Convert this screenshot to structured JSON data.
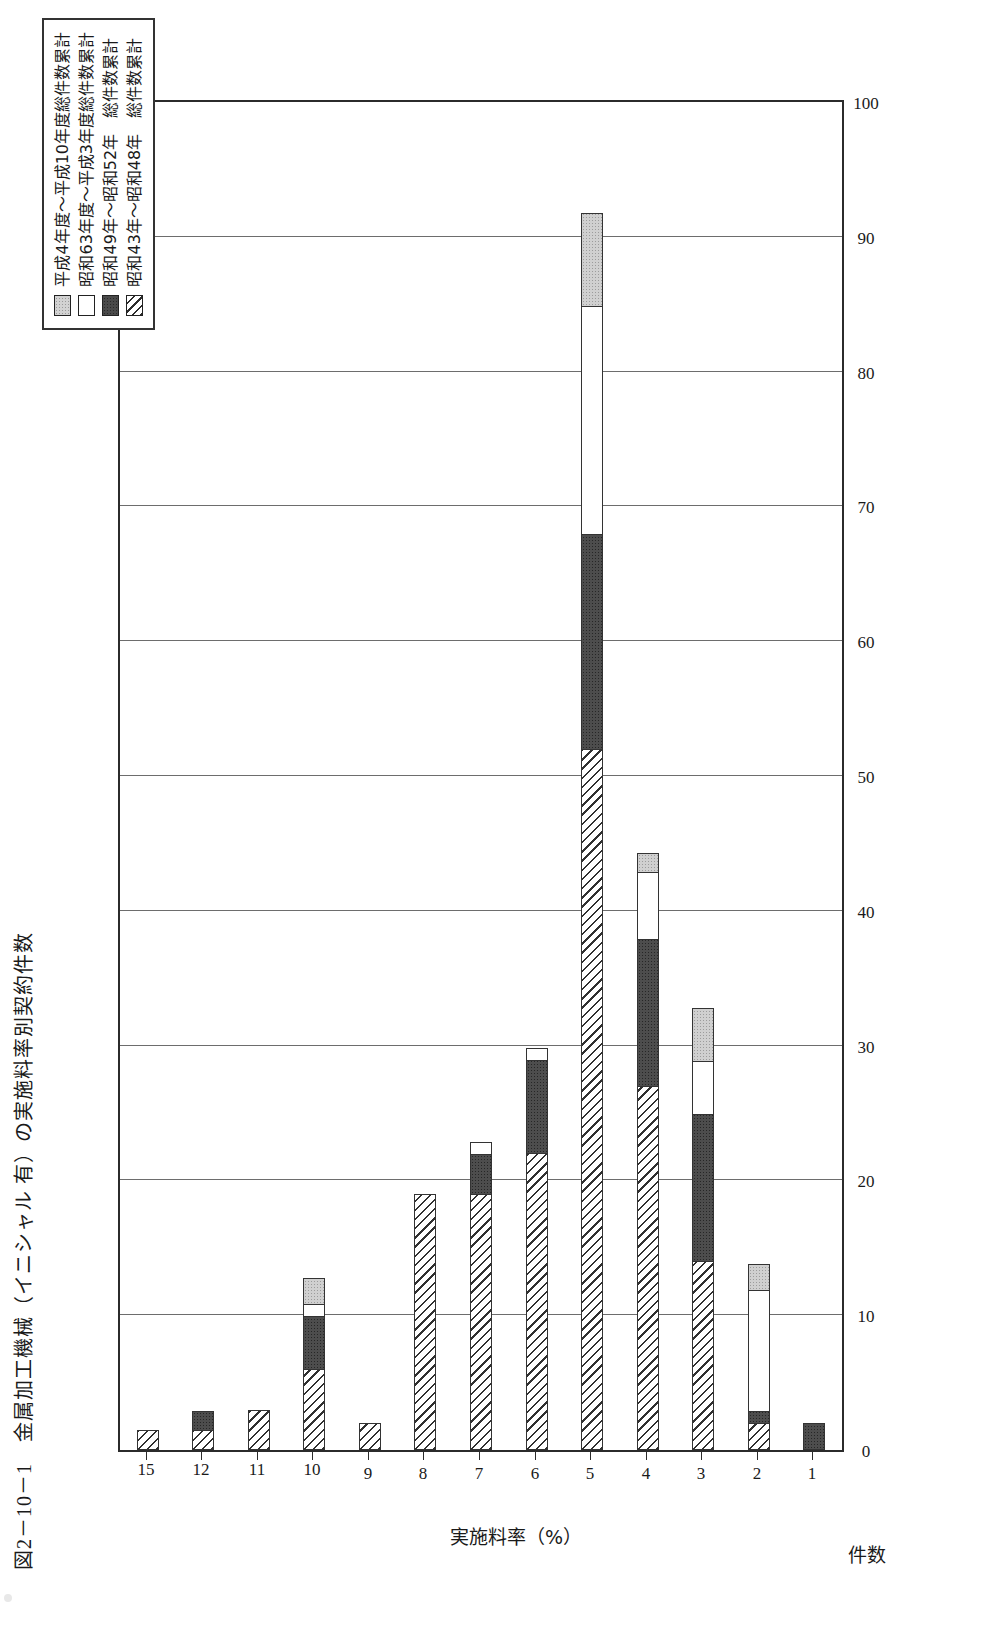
{
  "figure": {
    "caption": "図2－10－1　金属加工機械（イニシャル 有）の実施料率別契約件数"
  },
  "legend": {
    "items": [
      {
        "label": "平成4年度～平成10年度総件数累計",
        "pattern": "light-gray-dotted"
      },
      {
        "label": "昭和63年度～平成3年度総件数累計",
        "pattern": "white"
      },
      {
        "label": "昭和49年～昭和52年　総件数累計",
        "pattern": "dark-gray-dotted"
      },
      {
        "label": "昭和43年～昭和48年　総件数累計",
        "pattern": "diagonal-hatch"
      }
    ]
  },
  "chart_data": {
    "type": "bar",
    "title": "金属加工機械（イニシャル 有）の実施料率別契約件数",
    "xlabel": "実施料率（%）",
    "ylabel": "件数",
    "stacked": true,
    "orientation": "vertical",
    "grid": true,
    "legend_position": "top-right",
    "categories": [
      "1",
      "2",
      "3",
      "4",
      "5",
      "6",
      "7",
      "8",
      "9",
      "10",
      "11",
      "12",
      "15"
    ],
    "ylim": [
      0,
      100
    ],
    "yticks": [
      0,
      10,
      20,
      30,
      40,
      50,
      60,
      70,
      80,
      90,
      100
    ],
    "series": [
      {
        "name": "昭和43年～昭和48年　総件数累計",
        "pattern": "diagonal-hatch",
        "values": [
          0,
          2,
          14,
          27,
          52,
          22,
          19,
          19,
          2,
          6,
          3,
          1.5,
          1.5
        ]
      },
      {
        "name": "昭和49年～昭和52年　総件数累計",
        "pattern": "dark-gray-dotted",
        "values": [
          2,
          1,
          11,
          11,
          16,
          7,
          3,
          0,
          0,
          4,
          0,
          1.5,
          0
        ]
      },
      {
        "name": "昭和63年度～平成3年度総件数累計",
        "pattern": "white",
        "values": [
          0,
          9,
          4,
          5,
          17,
          1,
          1,
          0,
          0,
          1,
          0,
          0,
          0
        ]
      },
      {
        "name": "平成4年度～平成10年度総件数累計",
        "pattern": "light-gray-dotted",
        "values": [
          0,
          2,
          4,
          1.5,
          7,
          0,
          0,
          0,
          0,
          2,
          0,
          0,
          0
        ]
      }
    ],
    "totals": [
      2,
      14,
      33,
      44.5,
      92,
      30,
      23,
      19,
      2,
      13,
      3,
      3,
      1.5
    ]
  }
}
